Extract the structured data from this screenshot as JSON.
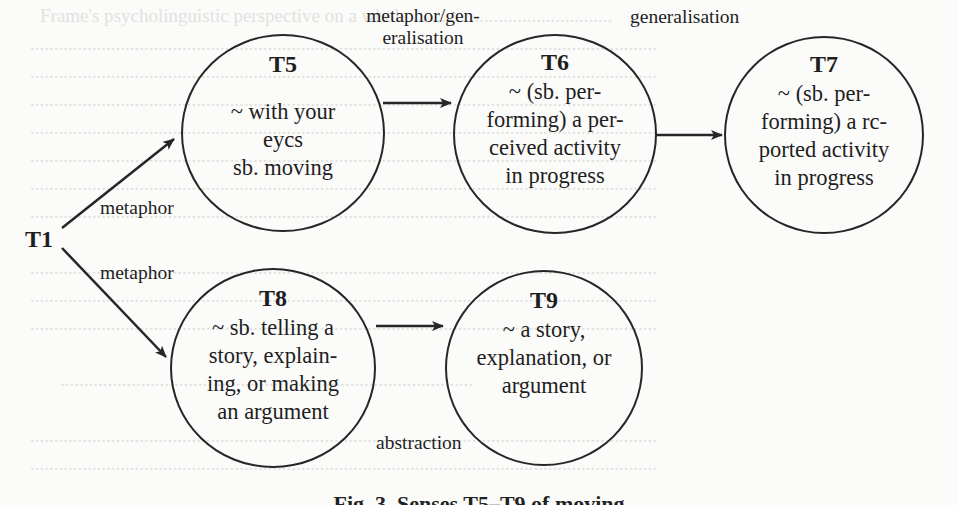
{
  "diagram": {
    "root": {
      "id": "T1",
      "label": "T1"
    },
    "nodes": [
      {
        "id": "T5",
        "title": "T5",
        "body": "~ with your\neycs\nsb. moving"
      },
      {
        "id": "T6",
        "title": "T6",
        "body": "~ (sb. per-\nforming) a per-\nceived activity\nin progress"
      },
      {
        "id": "T7",
        "title": "T7",
        "body": "~ (sb. per-\nforming) a rc-\nported activity\nin progress"
      },
      {
        "id": "T8",
        "title": "T8",
        "body": "~ sb. telling a\nstory, explain-\ning, or making\nan argument"
      },
      {
        "id": "T9",
        "title": "T9",
        "body": "~ a story,\nexplanation, or\nargument"
      }
    ],
    "edges": [
      {
        "from": "T1",
        "to": "T5",
        "label": "metaphor"
      },
      {
        "from": "T1",
        "to": "T8",
        "label": "metaphor"
      },
      {
        "from": "T5",
        "to": "T6",
        "label": "metaphor/gen-\neralisation"
      },
      {
        "from": "T6",
        "to": "T7",
        "label": "generalisation"
      },
      {
        "from": "T8",
        "to": "T9",
        "label": "abstraction"
      }
    ],
    "caption": "Fig. 3. Senses T5–T9 of moving"
  },
  "colors": {
    "stroke": "#262626",
    "background": "#fbfbfa",
    "bleed_text": "#d9d9d6"
  }
}
